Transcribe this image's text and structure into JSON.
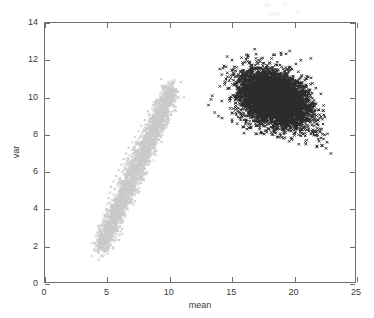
{
  "chart_data": {
    "type": "scatter",
    "title": "",
    "xlabel": "mean",
    "ylabel": "var",
    "xlim": [
      0,
      25
    ],
    "ylim": [
      0,
      14
    ],
    "xticks": [
      0,
      5,
      10,
      15,
      20,
      25
    ],
    "yticks": [
      0,
      2,
      4,
      6,
      8,
      10,
      12,
      14
    ],
    "xtick_labels": [
      "0",
      "5",
      "10",
      "15",
      "20",
      "25"
    ],
    "ytick_labels": [
      "0",
      "2",
      "4",
      "6",
      "8",
      "10",
      "12",
      "14"
    ],
    "grid": false,
    "legend": false,
    "legend_position": "none",
    "marker": "x",
    "series": [
      {
        "name": "light-cluster",
        "color": "#c9c9c9",
        "marker": "x",
        "n_points": 2400,
        "shape": "elongated diagonal band",
        "x_range": [
          4.0,
          10.2
        ],
        "y_range": [
          1.8,
          10.8
        ],
        "x_mean": 6.6,
        "y_mean": 6.2,
        "points": [
          [
            4.5,
            1.9
          ],
          [
            4.6,
            2.2
          ],
          [
            4.4,
            2.5
          ],
          [
            4.7,
            2.4
          ],
          [
            4.5,
            2.8
          ],
          [
            4.8,
            2.7
          ],
          [
            4.6,
            3.1
          ],
          [
            4.9,
            3.0
          ],
          [
            4.7,
            3.4
          ],
          [
            5.0,
            3.3
          ],
          [
            4.8,
            3.7
          ],
          [
            5.1,
            3.6
          ],
          [
            4.9,
            4.0
          ],
          [
            5.2,
            3.9
          ],
          [
            5.0,
            4.3
          ],
          [
            5.3,
            4.2
          ],
          [
            5.1,
            4.6
          ],
          [
            5.4,
            4.5
          ],
          [
            5.2,
            4.9
          ],
          [
            5.5,
            4.8
          ],
          [
            5.3,
            5.2
          ],
          [
            5.6,
            5.1
          ],
          [
            5.5,
            5.5
          ],
          [
            5.8,
            5.4
          ],
          [
            5.7,
            5.8
          ],
          [
            6.0,
            5.7
          ],
          [
            5.9,
            6.1
          ],
          [
            6.2,
            6.0
          ],
          [
            6.1,
            6.4
          ],
          [
            6.4,
            6.3
          ],
          [
            6.3,
            6.7
          ],
          [
            6.6,
            6.6
          ],
          [
            6.5,
            7.0
          ],
          [
            6.8,
            6.9
          ],
          [
            6.7,
            7.3
          ],
          [
            7.0,
            7.2
          ],
          [
            7.0,
            7.6
          ],
          [
            7.3,
            7.5
          ],
          [
            7.2,
            7.9
          ],
          [
            7.5,
            7.8
          ],
          [
            7.5,
            8.2
          ],
          [
            7.8,
            8.1
          ],
          [
            7.7,
            8.5
          ],
          [
            8.0,
            8.4
          ],
          [
            8.0,
            8.8
          ],
          [
            8.3,
            8.7
          ],
          [
            8.3,
            9.1
          ],
          [
            8.6,
            9.0
          ],
          [
            8.6,
            9.4
          ],
          [
            8.9,
            9.3
          ],
          [
            8.9,
            9.7
          ],
          [
            9.2,
            9.6
          ],
          [
            9.3,
            10.0
          ],
          [
            9.6,
            9.9
          ],
          [
            9.7,
            10.3
          ],
          [
            10.0,
            10.2
          ],
          [
            9.9,
            10.6
          ],
          [
            10.2,
            10.5
          ]
        ]
      },
      {
        "name": "dark-cluster",
        "color": "#2b2b2b",
        "marker": "x",
        "n_points": 5200,
        "shape": "dense blob",
        "x_range": [
          13.0,
          23.0
        ],
        "y_range": [
          6.8,
          12.7
        ],
        "x_mean": 18.4,
        "y_mean": 9.9,
        "points": [
          [
            13.1,
            9.6
          ],
          [
            13.4,
            10.1
          ],
          [
            13.6,
            9.2
          ],
          [
            14.0,
            10.6
          ],
          [
            14.2,
            8.9
          ],
          [
            14.5,
            11.0
          ],
          [
            14.8,
            9.8
          ],
          [
            15.1,
            11.5
          ],
          [
            15.4,
            8.6
          ],
          [
            15.7,
            10.4
          ],
          [
            16.0,
            11.9
          ],
          [
            16.3,
            9.1
          ],
          [
            16.6,
            10.9
          ],
          [
            16.9,
            12.1
          ],
          [
            17.2,
            8.4
          ],
          [
            17.5,
            10.2
          ],
          [
            17.8,
            11.6
          ],
          [
            18.1,
            9.4
          ],
          [
            18.4,
            12.3
          ],
          [
            18.7,
            10.7
          ],
          [
            19.0,
            8.8
          ],
          [
            19.3,
            11.3
          ],
          [
            19.6,
            12.5
          ],
          [
            19.9,
            9.9
          ],
          [
            20.2,
            10.8
          ],
          [
            20.5,
            12.0
          ],
          [
            20.8,
            8.5
          ],
          [
            21.1,
            11.1
          ],
          [
            21.4,
            9.7
          ],
          [
            21.7,
            10.5
          ],
          [
            22.0,
            8.2
          ],
          [
            22.3,
            9.3
          ],
          [
            22.6,
            7.6
          ],
          [
            22.9,
            7.0
          ],
          [
            22.4,
            8.0
          ],
          [
            21.8,
            7.4
          ],
          [
            20.9,
            7.5
          ],
          [
            19.8,
            7.8
          ],
          [
            18.6,
            7.9
          ],
          [
            17.4,
            8.1
          ],
          [
            16.2,
            8.3
          ],
          [
            15.0,
            8.7
          ],
          [
            13.9,
            9.0
          ],
          [
            13.3,
            9.9
          ],
          [
            14.6,
            12.2
          ],
          [
            16.8,
            12.6
          ],
          [
            18.9,
            12.4
          ],
          [
            20.1,
            11.8
          ],
          [
            21.3,
            12.1
          ],
          [
            22.1,
            10.2
          ]
        ]
      }
    ]
  },
  "axes": {
    "xtitle": "mean",
    "ytitle": "var"
  }
}
